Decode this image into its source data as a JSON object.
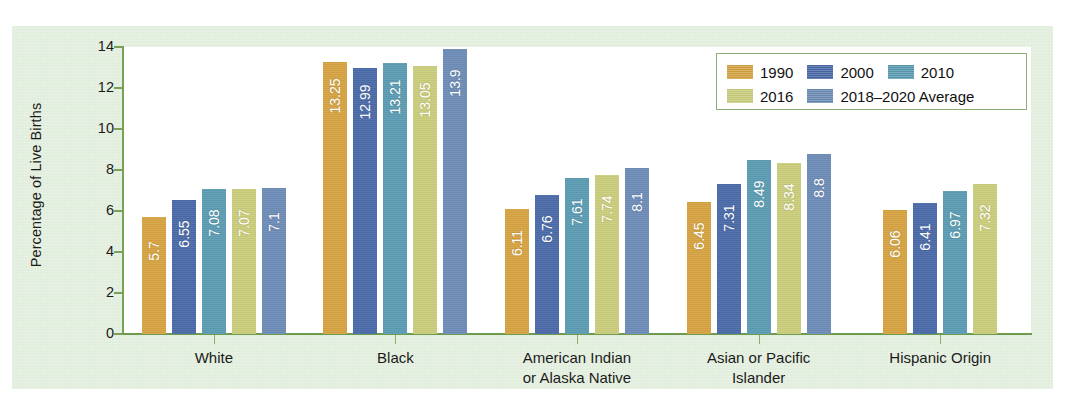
{
  "chart_data": {
    "type": "bar",
    "title": "",
    "xlabel": "",
    "ylabel": "Percentage of Live Births",
    "ylim": [
      0,
      14
    ],
    "yticks": [
      0,
      2,
      4,
      6,
      8,
      10,
      12,
      14
    ],
    "ytick_labels": [
      "0",
      "2",
      "4",
      "6",
      "8",
      "10",
      "12",
      "14"
    ],
    "grid": false,
    "legend_position": "top-right",
    "categories": [
      "White",
      "Black",
      "American Indian\nor Alaska Native",
      "Asian or Pacific\nIslander",
      "Hispanic Origin"
    ],
    "category_lines": [
      [
        "White"
      ],
      [
        "Black"
      ],
      [
        "American Indian",
        "or Alaska Native"
      ],
      [
        "Asian or Pacific",
        "Islander"
      ],
      [
        "Hispanic Origin"
      ]
    ],
    "series": [
      {
        "name": "1990",
        "color": "#d6a342",
        "values": [
          5.7,
          13.25,
          6.11,
          6.45,
          6.06
        ]
      },
      {
        "name": "2000",
        "color": "#4a6aa8",
        "values": [
          6.55,
          12.99,
          6.76,
          7.31,
          6.41
        ]
      },
      {
        "name": "2010",
        "color": "#5b9cb2",
        "values": [
          7.08,
          13.21,
          7.61,
          8.49,
          6.97
        ]
      },
      {
        "name": "2016",
        "color": "#cbcd7c",
        "values": [
          7.07,
          13.05,
          7.74,
          8.34,
          7.32
        ]
      },
      {
        "name": "2018–2020 Average",
        "color": "#6d8cb6",
        "values": [
          7.1,
          13.9,
          8.1,
          8.8,
          null
        ]
      }
    ],
    "value_labels": [
      [
        "5.7",
        "6.55",
        "7.08",
        "7.07",
        "7.1"
      ],
      [
        "13.25",
        "12.99",
        "13.21",
        "13.05",
        "13.9"
      ],
      [
        "6.11",
        "6.76",
        "7.61",
        "7.74",
        "8.1"
      ],
      [
        "6.45",
        "7.31",
        "8.49",
        "8.34",
        "8.8"
      ],
      [
        "6.06",
        "6.41",
        "6.97",
        "7.32",
        null
      ]
    ]
  },
  "legend": {
    "rows": [
      [
        {
          "label": "1990",
          "color": "#d6a342"
        },
        {
          "label": "2000",
          "color": "#4a6aa8"
        },
        {
          "label": "2010",
          "color": "#5b9cb2"
        }
      ],
      [
        {
          "label": "2016",
          "color": "#cbcd7c"
        },
        {
          "label": "2018–2020 Average",
          "color": "#6d8cb6"
        }
      ]
    ]
  },
  "colors": {
    "panel_background": "#e2eedd",
    "plot_background": "#ffffff",
    "axis": "#7aa05a",
    "legend_border": "#8fae73",
    "text": "#1b1b1b",
    "value_label": "#ffffff"
  }
}
